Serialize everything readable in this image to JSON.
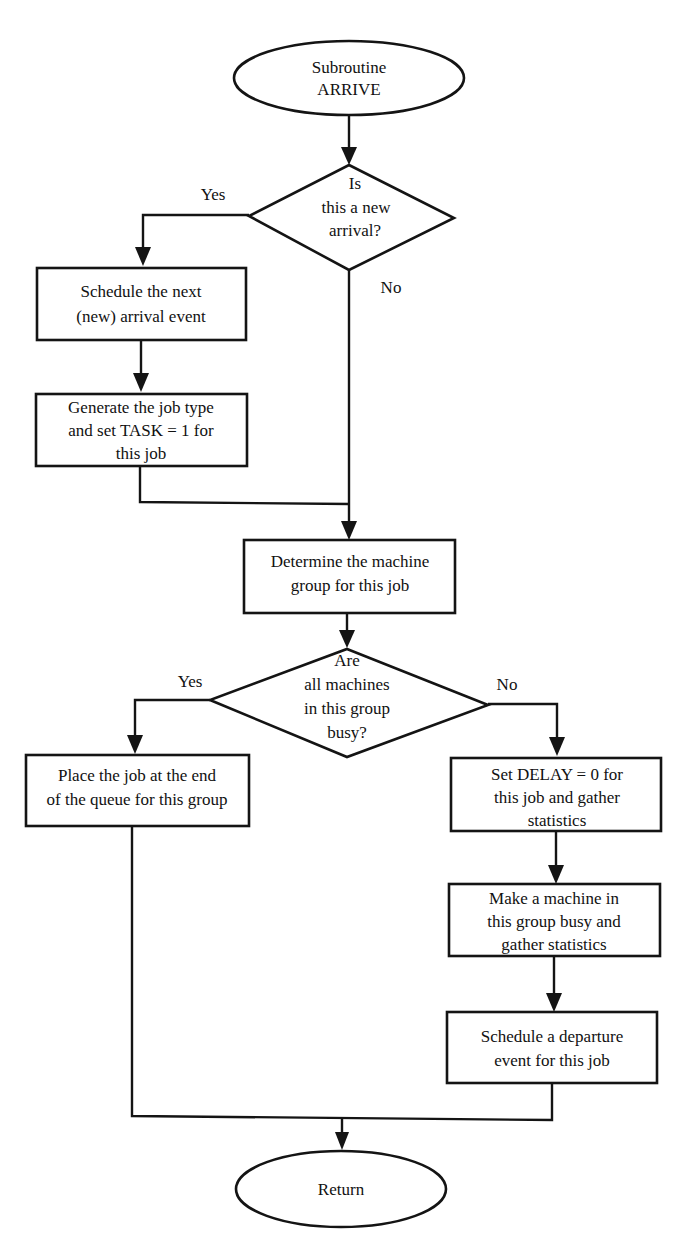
{
  "diagram": {
    "type": "flowchart",
    "title": "Subroutine ARRIVE",
    "colors": {
      "stroke": "#141414",
      "text": "#111111",
      "background": "#ffffff"
    },
    "nodes": {
      "start": {
        "shape": "ellipse",
        "lines": [
          "Subroutine",
          "ARRIVE"
        ]
      },
      "new_arrival": {
        "shape": "diamond",
        "lines": [
          "Is",
          "this a new",
          "arrival?"
        ]
      },
      "schedule_next": {
        "shape": "rect",
        "lines": [
          "Schedule the next",
          "(new) arrival event"
        ]
      },
      "gen_job": {
        "shape": "rect",
        "lines": [
          "Generate the job type",
          "and set TASK = 1 for",
          "this job"
        ]
      },
      "determine": {
        "shape": "rect",
        "lines": [
          "Determine the machine",
          "group for this job"
        ]
      },
      "all_busy": {
        "shape": "diamond",
        "lines": [
          "Are",
          "all machines",
          "in this group",
          "busy?"
        ]
      },
      "place_queue": {
        "shape": "rect",
        "lines": [
          "Place the job at the end",
          "of the queue for this group"
        ]
      },
      "set_delay": {
        "shape": "rect",
        "lines": [
          "Set DELAY = 0 for",
          "this job and gather",
          "statistics"
        ]
      },
      "make_busy": {
        "shape": "rect",
        "lines": [
          "Make a machine in",
          "this group busy and",
          "gather statistics"
        ]
      },
      "sched_depart": {
        "shape": "rect",
        "lines": [
          "Schedule a departure",
          "event for this job"
        ]
      },
      "end": {
        "shape": "ellipse",
        "lines": [
          "Return"
        ]
      }
    },
    "edge_labels": {
      "new_arrival_yes": "Yes",
      "new_arrival_no": "No",
      "all_busy_yes": "Yes",
      "all_busy_no": "No"
    },
    "edges": [
      [
        "start",
        "new_arrival",
        ""
      ],
      [
        "new_arrival",
        "schedule_next",
        "Yes"
      ],
      [
        "new_arrival",
        "determine",
        "No"
      ],
      [
        "schedule_next",
        "gen_job",
        ""
      ],
      [
        "gen_job",
        "determine",
        ""
      ],
      [
        "determine",
        "all_busy",
        ""
      ],
      [
        "all_busy",
        "place_queue",
        "Yes"
      ],
      [
        "all_busy",
        "set_delay",
        "No"
      ],
      [
        "set_delay",
        "make_busy",
        ""
      ],
      [
        "make_busy",
        "sched_depart",
        ""
      ],
      [
        "place_queue",
        "end",
        ""
      ],
      [
        "sched_depart",
        "end",
        ""
      ]
    ]
  }
}
